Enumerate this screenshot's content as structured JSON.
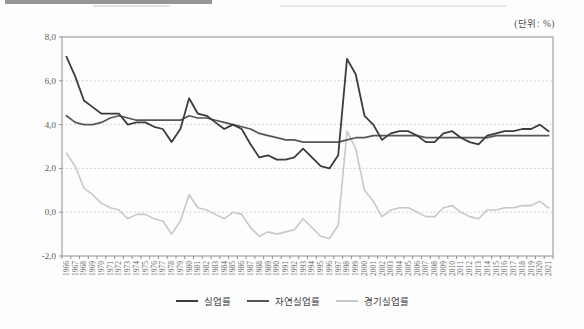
{
  "chart_data": {
    "type": "line",
    "title": "",
    "unit_label": "(단위: %)",
    "legend_position": "bottom",
    "grid": "horizontal-dotted",
    "ylim": [
      -2.0,
      8.0
    ],
    "yticks": [
      {
        "v": 8,
        "label": "8,0"
      },
      {
        "v": 6,
        "label": "6,0"
      },
      {
        "v": 4,
        "label": "4,0"
      },
      {
        "v": 2,
        "label": "2,0"
      },
      {
        "v": 0,
        "label": "0,0"
      },
      {
        "v": -2,
        "label": "-2,0"
      }
    ],
    "grid_values": [
      6,
      4,
      2,
      0
    ],
    "x": [
      "1966",
      "1967",
      "1968",
      "1969",
      "1970",
      "1971",
      "1972",
      "1973",
      "1974",
      "1975",
      "1976",
      "1977",
      "1978",
      "1979",
      "1980",
      "1981",
      "1982",
      "1983",
      "1984",
      "1985",
      "1986",
      "1987",
      "1988",
      "1989",
      "1990",
      "1991",
      "1992",
      "1993",
      "1994",
      "1995",
      "1996",
      "1997",
      "1998",
      "1999",
      "2000",
      "2001",
      "2002",
      "2003",
      "2004",
      "2005",
      "2006",
      "2007",
      "2008",
      "2009",
      "2010",
      "2011",
      "2012",
      "2013",
      "2014",
      "2015",
      "2016",
      "2017",
      "2018",
      "2019",
      "2020",
      "2021"
    ],
    "series": [
      {
        "name": "실업률",
        "color": "#3c3c3c",
        "width": 1.8,
        "values": [
          7.1,
          6.2,
          5.1,
          4.8,
          4.5,
          4.5,
          4.5,
          4.0,
          4.1,
          4.1,
          3.9,
          3.8,
          3.2,
          3.8,
          5.2,
          4.5,
          4.4,
          4.1,
          3.8,
          4.0,
          3.8,
          3.1,
          2.5,
          2.6,
          2.4,
          2.4,
          2.5,
          2.9,
          2.5,
          2.1,
          2.0,
          2.6,
          7.0,
          6.3,
          4.4,
          4.0,
          3.3,
          3.6,
          3.7,
          3.7,
          3.5,
          3.2,
          3.2,
          3.6,
          3.7,
          3.4,
          3.2,
          3.1,
          3.5,
          3.6,
          3.7,
          3.7,
          3.8,
          3.8,
          4.0,
          3.7
        ]
      },
      {
        "name": "자연실업률",
        "color": "#565656",
        "width": 1.7,
        "values": [
          4.4,
          4.1,
          4.0,
          4.0,
          4.1,
          4.3,
          4.4,
          4.3,
          4.2,
          4.2,
          4.2,
          4.2,
          4.2,
          4.2,
          4.4,
          4.3,
          4.3,
          4.2,
          4.1,
          4.0,
          3.9,
          3.8,
          3.6,
          3.5,
          3.4,
          3.3,
          3.3,
          3.2,
          3.2,
          3.2,
          3.2,
          3.2,
          3.3,
          3.4,
          3.4,
          3.5,
          3.5,
          3.5,
          3.5,
          3.5,
          3.5,
          3.4,
          3.4,
          3.4,
          3.4,
          3.4,
          3.4,
          3.4,
          3.4,
          3.5,
          3.5,
          3.5,
          3.5,
          3.5,
          3.5,
          3.5
        ]
      },
      {
        "name": "경기실업률",
        "color": "#c8c8c8",
        "width": 1.6,
        "values": [
          2.7,
          2.1,
          1.1,
          0.8,
          0.4,
          0.2,
          0.1,
          -0.3,
          -0.1,
          -0.1,
          -0.3,
          -0.4,
          -1.0,
          -0.4,
          0.8,
          0.2,
          0.1,
          -0.1,
          -0.3,
          0.0,
          -0.1,
          -0.7,
          -1.1,
          -0.9,
          -1.0,
          -0.9,
          -0.8,
          -0.3,
          -0.7,
          -1.1,
          -1.2,
          -0.6,
          3.7,
          2.9,
          1.0,
          0.5,
          -0.2,
          0.1,
          0.2,
          0.2,
          0.0,
          -0.2,
          -0.2,
          0.2,
          0.3,
          0.0,
          -0.2,
          -0.3,
          0.1,
          0.1,
          0.2,
          0.2,
          0.3,
          0.3,
          0.5,
          0.2
        ]
      }
    ]
  }
}
